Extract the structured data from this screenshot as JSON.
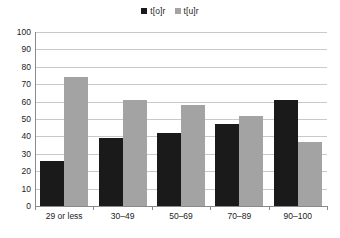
{
  "chart_data": {
    "type": "bar",
    "title": "",
    "subtitle": "",
    "xlabel": "",
    "ylabel": "",
    "categories": [
      "29 or less",
      "30–49",
      "50–69",
      "70–89",
      "90–100"
    ],
    "series": [
      {
        "name": "t[o]r",
        "color": "#1a1a1a",
        "values": [
          26,
          39,
          42,
          47,
          61
        ]
      },
      {
        "name": "t[u]r",
        "color": "#a3a3a3",
        "values": [
          74,
          61,
          58,
          52,
          37
        ]
      }
    ],
    "ylim": [
      0,
      100
    ],
    "ytick_labels": [
      "100",
      "90",
      "80",
      "70",
      "60",
      "50",
      "40",
      "30",
      "20",
      "10",
      "0"
    ],
    "ytick_values": [
      100,
      90,
      80,
      70,
      60,
      50,
      40,
      30,
      20,
      10,
      0
    ],
    "grid": true,
    "grid_axis": "y",
    "legend": [
      "t[o]r",
      "t[u]r"
    ],
    "legend_position": "top-center",
    "annotations": [],
    "background_color": "#ffffff",
    "gridline_color": "#c9c9c9",
    "axis_color": "#8a8a8a",
    "text_color": "#1c1c1c"
  }
}
